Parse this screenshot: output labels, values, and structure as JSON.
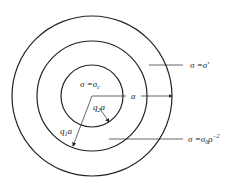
{
  "diagram": {
    "center": {
      "x": 92,
      "y": 96
    },
    "circles": [
      {
        "name": "outer",
        "r": 80
      },
      {
        "name": "middle",
        "r": 55
      },
      {
        "name": "inner",
        "r": 31
      }
    ],
    "stroke_color": "#222222",
    "labels": {
      "inner_region": "σ =σ",
      "inner_region_sub": "c",
      "outer_region": "σ =σ′",
      "middle_region_main": "σ =σ",
      "middle_region_sub": "0",
      "middle_region_rho": "ρ",
      "middle_region_exp": "−2",
      "radius_a": "a",
      "radius_q2a_q": "q",
      "radius_q2a_sub": "2",
      "radius_q2a_a": "a",
      "radius_q1a_q": "q",
      "radius_q1a_sub": "1",
      "radius_q1a_a": "a"
    }
  }
}
